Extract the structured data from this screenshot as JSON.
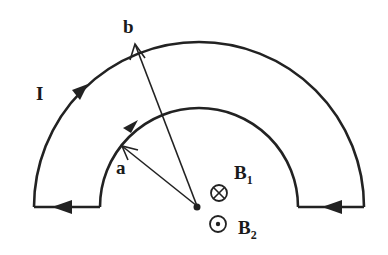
{
  "diagram": {
    "labels": {
      "current": "I",
      "outer_radius": "b",
      "inner_radius": "a",
      "field1_main": "B",
      "field1_sub": "1",
      "field2_main": "B",
      "field2_sub": "2"
    },
    "symbols": {
      "field1": "into-page (⊗)",
      "field2": "out-of-page (⊙)"
    },
    "colors": {
      "stroke": "#222222",
      "background": "#ffffff"
    }
  }
}
